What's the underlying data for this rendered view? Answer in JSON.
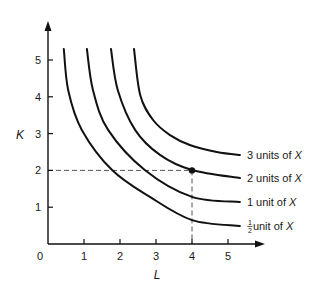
{
  "chart_data": {
    "type": "line",
    "title": "",
    "xlabel": "L",
    "ylabel": "K",
    "xlim": [
      0,
      5.6
    ],
    "ylim": [
      0,
      5.8
    ],
    "grid": false,
    "origin_label": "0",
    "x_ticks": [
      1,
      2,
      3,
      4,
      5
    ],
    "y_ticks": [
      1,
      2,
      3,
      4,
      5
    ],
    "series": [
      {
        "name": "1/2 unit of X",
        "label": {
          "fraction_num": "1",
          "fraction_den": "2",
          "text": " unit of ",
          "var": "X"
        },
        "points": [
          [
            0.44,
            5.3
          ],
          [
            0.56,
            4.18
          ],
          [
            0.94,
            3.1
          ],
          [
            1.78,
            2.01
          ],
          [
            2.83,
            1.28
          ],
          [
            4.0,
            0.65
          ],
          [
            5.33,
            0.49
          ]
        ]
      },
      {
        "name": "1 unit of X",
        "label": {
          "text": "1 unit of ",
          "var": "X"
        },
        "points": [
          [
            1.08,
            5.3
          ],
          [
            1.25,
            4.18
          ],
          [
            1.67,
            3.1
          ],
          [
            2.69,
            2.01
          ],
          [
            4.0,
            1.28
          ],
          [
            5.33,
            1.14
          ]
        ]
      },
      {
        "name": "2 units of X",
        "label": {
          "text": "2 units of ",
          "var": "X"
        },
        "points": [
          [
            1.75,
            5.3
          ],
          [
            1.94,
            4.18
          ],
          [
            2.42,
            3.1
          ],
          [
            3.11,
            2.42
          ],
          [
            4.0,
            2.01
          ],
          [
            5.33,
            1.79
          ]
        ]
      },
      {
        "name": "3 units of X",
        "label": {
          "text": "3 units of ",
          "var": "X"
        },
        "points": [
          [
            2.39,
            5.3
          ],
          [
            2.56,
            4.05
          ],
          [
            2.92,
            3.37
          ],
          [
            3.39,
            2.96
          ],
          [
            3.94,
            2.69
          ],
          [
            4.69,
            2.5
          ],
          [
            5.33,
            2.42
          ]
        ]
      }
    ],
    "annotations": {
      "highlight_point": [
        4,
        2
      ],
      "dashed_guides": {
        "L": 4,
        "K": 2
      }
    }
  },
  "colors": {
    "ink": "#111111",
    "guide": "#555555",
    "background": "#ffffff"
  }
}
